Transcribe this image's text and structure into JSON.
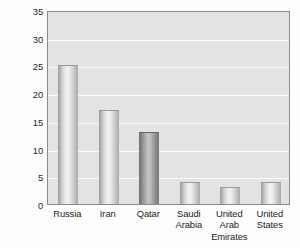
{
  "chart_data": {
    "type": "bar",
    "title": "",
    "subtitle": "",
    "xlabel": "",
    "ylabel": "Percent of world natural gas reserves,\n2013",
    "categories": [
      "Russia",
      "Iran",
      "Qatar",
      "Saudi\nArabia",
      "United\nArab\nEmirates",
      "United\nStates"
    ],
    "values": [
      25,
      17,
      13,
      4,
      3,
      4
    ],
    "ylim": [
      0,
      35
    ],
    "yticks": [
      0,
      5,
      10,
      15,
      20,
      25,
      30,
      35
    ],
    "ytick_labels": [
      "0",
      "5",
      "10",
      "15",
      "20",
      "25",
      "30",
      "35"
    ],
    "grid": "horizontal",
    "legend": "none",
    "plot_background": "#e3e3e3",
    "gridline_color": "#fbfbfb",
    "bar_styles": [
      "light",
      "light",
      "dark",
      "light",
      "light",
      "light"
    ]
  }
}
